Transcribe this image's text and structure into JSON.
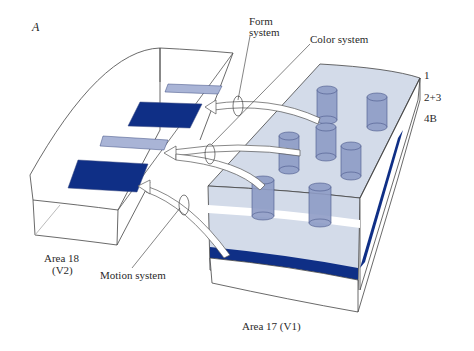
{
  "figure": {
    "panel_letter": "A",
    "colors": {
      "dark_blue": "#0f2f86",
      "light_blue": "#a9b4d6",
      "v1_fill": "#d3dbe9",
      "cylinder": "#8e9cc6",
      "line": "#3a3a3a"
    },
    "labels": {
      "form_system_line1": "Form",
      "form_system_line2": "system",
      "color_system": "Color system",
      "motion_system": "Motion system",
      "area18_line1": "Area 18",
      "area18_line2": "(V2)",
      "area17": "Area 17 (V1)"
    },
    "layers": [
      {
        "label": "1"
      },
      {
        "label": "2+3"
      },
      {
        "label": "4B"
      }
    ]
  }
}
